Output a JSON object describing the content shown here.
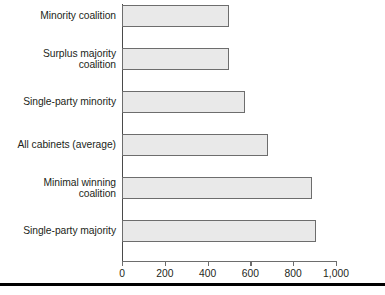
{
  "chart_data": {
    "type": "bar",
    "orientation": "horizontal",
    "title": "",
    "xlabel": "",
    "ylabel": "",
    "xlim": [
      0,
      1000
    ],
    "grid": false,
    "legend": null,
    "xticks": [
      "0",
      "200",
      "400",
      "600",
      "800",
      "1,000"
    ],
    "xtick_values": [
      0,
      200,
      400,
      600,
      800,
      1000
    ],
    "categories": [
      "Minority coalition",
      "Surplus majority\ncoalition",
      "Single-party minority",
      "All cabinets (average)",
      "Minimal winning\ncoalition",
      "Single-party majority"
    ],
    "values": [
      500,
      500,
      575,
      680,
      890,
      905
    ],
    "series": [
      {
        "name": "Cabinet duration (days)",
        "values": [
          500,
          500,
          575,
          680,
          890,
          905
        ]
      }
    ],
    "bar_fill": "#e9e9e9",
    "bar_stroke": "#6d6d6d",
    "axis_color": "#6d6d6d",
    "text_color": "#231f20"
  }
}
